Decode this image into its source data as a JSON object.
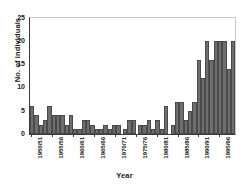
{
  "chart_data": {
    "type": "bar",
    "title": "",
    "xlabel": "Year",
    "ylabel": "No. of individuals",
    "ylim": [
      0,
      25
    ],
    "yticks": [
      0,
      5,
      10,
      15,
      20,
      25
    ],
    "grid": false,
    "legend": null,
    "bar_color": "#6e6e6e",
    "bar_edge_color": "#4a4a4a",
    "axis_color": "#3b3b3b",
    "categories": [
      "1950/51",
      "1951/52",
      "1952/53",
      "1953/54",
      "1954/55",
      "1955/56",
      "1956/57",
      "1957/58",
      "1958/59",
      "1959/60",
      "1960/61",
      "1961/62",
      "1962/63",
      "1963/64",
      "1964/65",
      "1965/66",
      "1966/67",
      "1967/68",
      "1968/69",
      "1969/70",
      "1970/71",
      "1971/72",
      "1972/73",
      "1973/74",
      "1974/75",
      "1975/76",
      "1976/77",
      "1977/78",
      "1978/79",
      "1979/80",
      "1980/81",
      "1981/82",
      "1982/83",
      "1983/84",
      "1984/85",
      "1985/86",
      "1986/87",
      "1987/88",
      "1988/89",
      "1989/90",
      "1990/91",
      "1991/92",
      "1992/93",
      "1993/94",
      "1994/95",
      "1995/96",
      "1996/97",
      "1997/98",
      "1998/99"
    ],
    "values": [
      6,
      4,
      2,
      3,
      6,
      4,
      4,
      4,
      2,
      4,
      1,
      1,
      3,
      3,
      2,
      1,
      1,
      2,
      1,
      2,
      2,
      0,
      1,
      3,
      3,
      0,
      2,
      2,
      3,
      1,
      3,
      1,
      6,
      0,
      2,
      7,
      7,
      3,
      5,
      7,
      16,
      12,
      20,
      16,
      20,
      20,
      20,
      14,
      20
    ],
    "xtick_labels": [
      "1950/51",
      "1955/56",
      "1960/61",
      "1965/66",
      "1970/71",
      "1975/76",
      "1980/81",
      "1985/86",
      "1990/91",
      "1995/96"
    ],
    "xtick_indices": [
      0,
      5,
      10,
      15,
      20,
      25,
      30,
      35,
      40,
      45
    ]
  }
}
